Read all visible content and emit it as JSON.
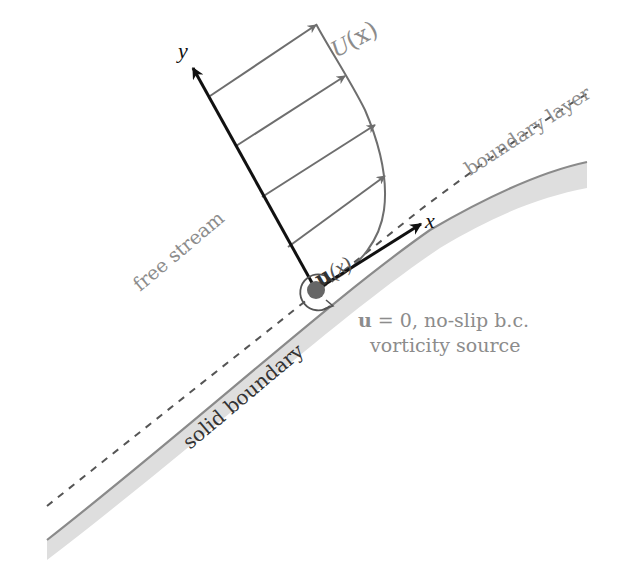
{
  "diagram": {
    "type": "boundary-layer-schematic",
    "colors": {
      "axis": "#111111",
      "profile": "#6e6e6e",
      "boundary_fill": "#dcdcdc",
      "boundary_edge": "#8a8a8a",
      "dashed": "#555555",
      "label": "#8c8c8c",
      "label_dark": "#333333",
      "dot": "#666666"
    },
    "labels": {
      "y_axis": "y",
      "x_axis": "x",
      "profile": "U(x)",
      "profile_U": "U",
      "profile_arg": "(x)",
      "local_velocity": "u(x)",
      "local_velocity_u": "u",
      "local_velocity_arg": "(x)",
      "boundary_layer": "boundary layer",
      "free_stream": "free stream",
      "solid_boundary": "solid boundary",
      "no_slip": "u = 0, no-slip b.c.",
      "no_slip_u": "u",
      "no_slip_rest": " = 0, no-slip b.c.",
      "vorticity_source": "vorticity source"
    },
    "profile_arrows": 4
  }
}
